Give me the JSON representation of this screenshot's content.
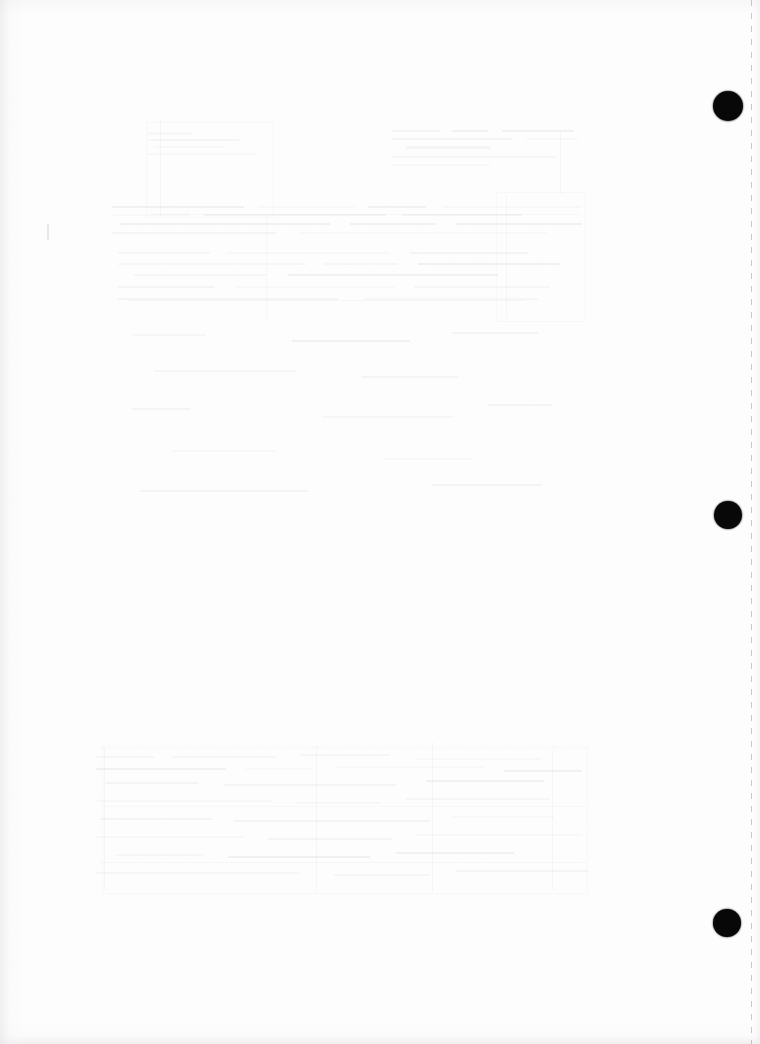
{
  "page": {
    "kind": "scanned-blank-page",
    "width_px": 760,
    "height_px": 1044,
    "background_color": "#fdfdfd",
    "visible_text": "",
    "caption": "Blank scanned page with three black binding punch holes along the right margin and faint bleed-through from the reverse side."
  },
  "punch_holes": {
    "label": "binding punch holes",
    "count": 3,
    "color": "#080808",
    "items": [
      {
        "name": "punch-hole-top",
        "cx": 728,
        "cy": 106,
        "r": 15
      },
      {
        "name": "punch-hole-middle",
        "cx": 728,
        "cy": 515,
        "r": 14
      },
      {
        "name": "punch-hole-bottom",
        "cx": 727,
        "cy": 923,
        "r": 14
      }
    ]
  },
  "perforation": {
    "label": "perforated tear edge",
    "x": 751,
    "color": "#969498"
  },
  "pencil_mark": {
    "label": "faint pencil tick",
    "x": 47,
    "y": 224,
    "width": 2,
    "height": 16
  },
  "bleed_through": {
    "label": "reverse-side show-through",
    "note": "Illegible ghosted text and ruled table structure from the printed side of the sheet.",
    "ink_color": "#76747a",
    "regions": [
      {
        "name": "ghost-region-upper-heading",
        "x": 148,
        "y": 130,
        "width": 116,
        "height": 30,
        "lines": [
          {
            "x": 0,
            "y": 2,
            "w": 44,
            "h": 3
          },
          {
            "x": 0,
            "y": 9,
            "w": 92,
            "h": 2
          },
          {
            "x": 6,
            "y": 16,
            "w": 70,
            "h": 2
          },
          {
            "x": 0,
            "y": 23,
            "w": 108,
            "h": 2
          }
        ]
      },
      {
        "name": "ghost-region-upper-right-block",
        "x": 392,
        "y": 128,
        "width": 190,
        "height": 46,
        "lines": [
          {
            "x": 0,
            "y": 2,
            "w": 48,
            "h": 2
          },
          {
            "x": 60,
            "y": 2,
            "w": 36,
            "h": 2
          },
          {
            "x": 110,
            "y": 2,
            "w": 72,
            "h": 2
          },
          {
            "x": 0,
            "y": 10,
            "w": 120,
            "h": 2
          },
          {
            "x": 134,
            "y": 10,
            "w": 52,
            "h": 2
          },
          {
            "x": 14,
            "y": 18,
            "w": 84,
            "h": 3
          },
          {
            "x": 0,
            "y": 28,
            "w": 164,
            "h": 2
          },
          {
            "x": 0,
            "y": 36,
            "w": 98,
            "h": 2
          }
        ]
      },
      {
        "name": "ghost-region-paragraph-band-a",
        "x": 112,
        "y": 206,
        "width": 470,
        "height": 34,
        "lines": [
          {
            "x": 0,
            "y": 0,
            "w": 132,
            "h": 2
          },
          {
            "x": 146,
            "y": 0,
            "w": 96,
            "h": 2
          },
          {
            "x": 256,
            "y": 0,
            "w": 58,
            "h": 2
          },
          {
            "x": 330,
            "y": 0,
            "w": 140,
            "h": 2
          },
          {
            "x": 0,
            "y": 8,
            "w": 78,
            "h": 2
          },
          {
            "x": 92,
            "y": 8,
            "w": 182,
            "h": 2
          },
          {
            "x": 290,
            "y": 8,
            "w": 120,
            "h": 2
          },
          {
            "x": 8,
            "y": 17,
            "w": 210,
            "h": 2
          },
          {
            "x": 238,
            "y": 17,
            "w": 86,
            "h": 2
          },
          {
            "x": 344,
            "y": 17,
            "w": 126,
            "h": 2
          },
          {
            "x": 0,
            "y": 26,
            "w": 164,
            "h": 2
          },
          {
            "x": 188,
            "y": 26,
            "w": 246,
            "h": 2
          }
        ]
      },
      {
        "name": "ghost-region-paragraph-band-b",
        "x": 118,
        "y": 252,
        "width": 452,
        "height": 60,
        "lines": [
          {
            "x": 0,
            "y": 0,
            "w": 92,
            "h": 2
          },
          {
            "x": 108,
            "y": 0,
            "w": 164,
            "h": 2
          },
          {
            "x": 292,
            "y": 0,
            "w": 118,
            "h": 2
          },
          {
            "x": 0,
            "y": 11,
            "w": 188,
            "h": 2
          },
          {
            "x": 206,
            "y": 11,
            "w": 74,
            "h": 2
          },
          {
            "x": 300,
            "y": 11,
            "w": 142,
            "h": 2
          },
          {
            "x": 16,
            "y": 22,
            "w": 132,
            "h": 2
          },
          {
            "x": 170,
            "y": 22,
            "w": 210,
            "h": 2
          },
          {
            "x": 0,
            "y": 34,
            "w": 96,
            "h": 2
          },
          {
            "x": 118,
            "y": 34,
            "w": 158,
            "h": 2
          },
          {
            "x": 296,
            "y": 34,
            "w": 136,
            "h": 2
          },
          {
            "x": 0,
            "y": 46,
            "w": 220,
            "h": 2
          },
          {
            "x": 246,
            "y": 46,
            "w": 174,
            "h": 2
          }
        ]
      },
      {
        "name": "ghost-region-mid-sparse",
        "x": 132,
        "y": 330,
        "width": 430,
        "height": 180,
        "lines": [
          {
            "x": 0,
            "y": 4,
            "w": 74,
            "h": 2
          },
          {
            "x": 160,
            "y": 10,
            "w": 118,
            "h": 2
          },
          {
            "x": 320,
            "y": 2,
            "w": 86,
            "h": 2
          },
          {
            "x": 22,
            "y": 40,
            "w": 142,
            "h": 2
          },
          {
            "x": 230,
            "y": 46,
            "w": 96,
            "h": 2
          },
          {
            "x": 0,
            "y": 78,
            "w": 58,
            "h": 2
          },
          {
            "x": 190,
            "y": 86,
            "w": 130,
            "h": 2
          },
          {
            "x": 356,
            "y": 74,
            "w": 64,
            "h": 2
          },
          {
            "x": 40,
            "y": 120,
            "w": 104,
            "h": 2
          },
          {
            "x": 252,
            "y": 128,
            "w": 88,
            "h": 2
          },
          {
            "x": 8,
            "y": 160,
            "w": 168,
            "h": 2
          },
          {
            "x": 300,
            "y": 154,
            "w": 110,
            "h": 2
          }
        ]
      },
      {
        "name": "ghost-region-lower-table",
        "x": 96,
        "y": 752,
        "width": 502,
        "height": 140,
        "lines": [
          {
            "x": 0,
            "y": 4,
            "w": 58,
            "h": 2
          },
          {
            "x": 76,
            "y": 4,
            "w": 104,
            "h": 2
          },
          {
            "x": 204,
            "y": 2,
            "w": 90,
            "h": 2
          },
          {
            "x": 320,
            "y": 6,
            "w": 126,
            "h": 2
          },
          {
            "x": 0,
            "y": 16,
            "w": 130,
            "h": 2
          },
          {
            "x": 150,
            "y": 16,
            "w": 66,
            "h": 2
          },
          {
            "x": 240,
            "y": 14,
            "w": 148,
            "h": 2
          },
          {
            "x": 408,
            "y": 18,
            "w": 78,
            "h": 2
          },
          {
            "x": 10,
            "y": 30,
            "w": 92,
            "h": 2
          },
          {
            "x": 128,
            "y": 32,
            "w": 172,
            "h": 2
          },
          {
            "x": 330,
            "y": 28,
            "w": 118,
            "h": 2
          },
          {
            "x": 0,
            "y": 48,
            "w": 176,
            "h": 2
          },
          {
            "x": 200,
            "y": 50,
            "w": 84,
            "h": 2
          },
          {
            "x": 310,
            "y": 46,
            "w": 144,
            "h": 2
          },
          {
            "x": 4,
            "y": 66,
            "w": 112,
            "h": 2
          },
          {
            "x": 138,
            "y": 68,
            "w": 196,
            "h": 2
          },
          {
            "x": 356,
            "y": 64,
            "w": 102,
            "h": 2
          },
          {
            "x": 0,
            "y": 84,
            "w": 148,
            "h": 2
          },
          {
            "x": 172,
            "y": 86,
            "w": 124,
            "h": 2
          },
          {
            "x": 320,
            "y": 82,
            "w": 166,
            "h": 2
          },
          {
            "x": 20,
            "y": 102,
            "w": 88,
            "h": 2
          },
          {
            "x": 132,
            "y": 104,
            "w": 142,
            "h": 2
          },
          {
            "x": 300,
            "y": 100,
            "w": 118,
            "h": 2
          },
          {
            "x": 0,
            "y": 120,
            "w": 204,
            "h": 2
          },
          {
            "x": 238,
            "y": 122,
            "w": 96,
            "h": 2
          },
          {
            "x": 360,
            "y": 118,
            "w": 132,
            "h": 2
          }
        ]
      }
    ],
    "rules": [
      {
        "name": "ghost-rule-v-1",
        "x": 160,
        "y": 120,
        "w": 1,
        "h": 96
      },
      {
        "name": "ghost-rule-v-2",
        "x": 266,
        "y": 214,
        "w": 1,
        "h": 110
      },
      {
        "name": "ghost-rule-v-3",
        "x": 506,
        "y": 196,
        "w": 1,
        "h": 122
      },
      {
        "name": "ghost-rule-v-4",
        "x": 560,
        "y": 132,
        "w": 1,
        "h": 62
      },
      {
        "name": "ghost-rule-v-5",
        "x": 104,
        "y": 748,
        "w": 1,
        "h": 142
      },
      {
        "name": "ghost-rule-v-6",
        "x": 316,
        "y": 746,
        "w": 1,
        "h": 148
      },
      {
        "name": "ghost-rule-v-7",
        "x": 432,
        "y": 742,
        "w": 1,
        "h": 150
      },
      {
        "name": "ghost-rule-v-8",
        "x": 552,
        "y": 750,
        "w": 1,
        "h": 140
      },
      {
        "name": "ghost-rule-h-1",
        "x": 150,
        "y": 214,
        "w": 430,
        "h": 1
      },
      {
        "name": "ghost-rule-h-2",
        "x": 128,
        "y": 300,
        "w": 398,
        "h": 1
      },
      {
        "name": "ghost-rule-h-3",
        "x": 100,
        "y": 748,
        "w": 486,
        "h": 1
      },
      {
        "name": "ghost-rule-h-4",
        "x": 100,
        "y": 806,
        "w": 486,
        "h": 1
      },
      {
        "name": "ghost-rule-h-5",
        "x": 100,
        "y": 862,
        "w": 486,
        "h": 1
      }
    ],
    "boxes": [
      {
        "name": "ghost-box-upper",
        "x": 146,
        "y": 122,
        "w": 126,
        "h": 94
      },
      {
        "name": "ghost-box-lower",
        "x": 102,
        "y": 746,
        "w": 484,
        "h": 146
      },
      {
        "name": "ghost-box-right",
        "x": 496,
        "y": 192,
        "w": 88,
        "h": 128
      }
    ]
  }
}
